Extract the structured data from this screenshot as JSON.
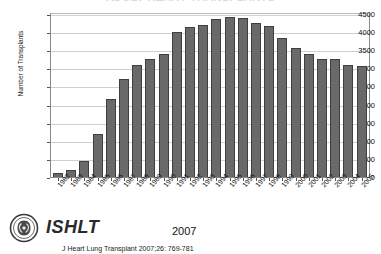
{
  "chart_data": {
    "type": "bar",
    "title": "ADULT HEART TRANSPLANTS",
    "xlabel": "",
    "ylabel": "Number of Transplants",
    "ylim": [
      0,
      4500
    ],
    "ytick_values": [
      0,
      500,
      1000,
      1500,
      2000,
      2500,
      3000,
      3500,
      4000,
      4500
    ],
    "ytick_labels": [
      "0",
      "500",
      "1000",
      "1500",
      "2000",
      "2500",
      "3000",
      "3500",
      "4000",
      "4500"
    ],
    "grid": true,
    "legend": null,
    "bar_color": "#696969",
    "categories": [
      "1982",
      "1983",
      "1984",
      "1985",
      "1986",
      "1987",
      "1988",
      "1989",
      "1990",
      "1991",
      "1992",
      "1993",
      "1994",
      "1995",
      "1996",
      "1997",
      "1998",
      "1999",
      "2000",
      "2001",
      "2002",
      "2003",
      "2004",
      "2005"
    ],
    "values": [
      100,
      200,
      450,
      1200,
      2150,
      2700,
      3100,
      3250,
      3400,
      4000,
      4150,
      4200,
      4350,
      4420,
      4400,
      4260,
      4160,
      3830,
      3550,
      3400,
      3250,
      3270,
      3100,
      3060
    ]
  },
  "footer": {
    "wordmark": "ISHLT",
    "year": "2007",
    "citation": "J Heart Lung Transplant 2007;26: 769-781",
    "logo_name": "ishlt-emblem"
  }
}
